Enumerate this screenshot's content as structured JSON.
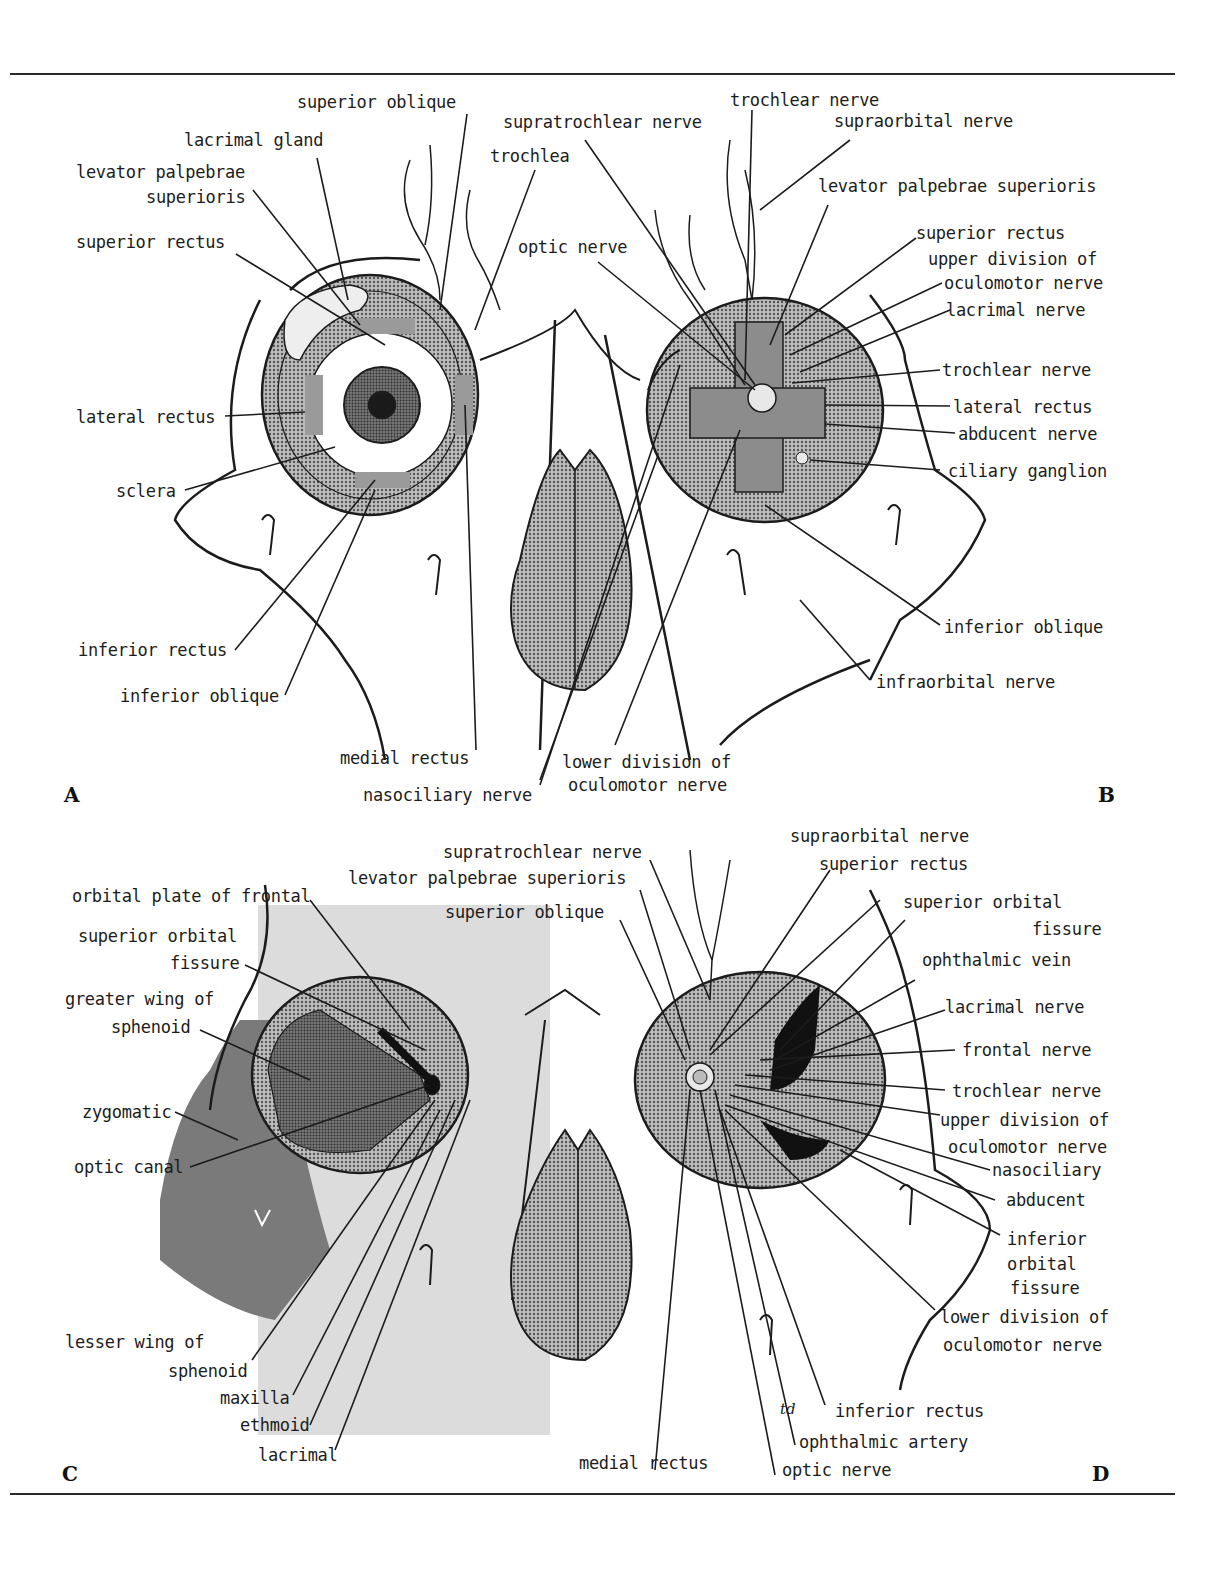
{
  "figure": {
    "panels": [
      {
        "letter": "A",
        "labels": {
          "superior_oblique": "superior oblique",
          "lacrimal_gland": "lacrimal gland",
          "levator_1": "levator palpebrae",
          "levator_2": "superioris",
          "superior_rectus": "superior rectus",
          "trochlea": "trochlea",
          "lateral_rectus": "lateral rectus",
          "sclera": "sclera",
          "inferior_rectus": "inferior rectus",
          "inferior_oblique": "inferior oblique",
          "medial_rectus": "medial rectus",
          "nasociliary_nerve": "nasociliary nerve"
        }
      },
      {
        "letter": "B",
        "labels": {
          "trochlear_nerve_top": "trochlear nerve",
          "supratrochlear_nerve": "supratrochlear nerve",
          "supraorbital_nerve": "supraorbital nerve",
          "levator": "levator palpebrae superioris",
          "optic_nerve": "optic nerve",
          "superior_rectus": "superior rectus",
          "upper_div_1": "upper division of",
          "upper_div_2": "oculomotor nerve",
          "lacrimal_nerve": "lacrimal nerve",
          "trochlear_nerve": "trochlear nerve",
          "lateral_rectus": "lateral rectus",
          "abducent_nerve": "abducent nerve",
          "ciliary_ganglion": "ciliary ganglion",
          "inferior_oblique": "inferior oblique",
          "infraorbital_nerve": "infraorbital nerve",
          "lower_div_1": "lower division of",
          "lower_div_2": "oculomotor nerve"
        }
      },
      {
        "letter": "C",
        "labels": {
          "orbital_plate": "orbital plate of frontal",
          "sof_1": "superior orbital",
          "sof_2": "fissure",
          "greater_wing_1": "greater wing of",
          "greater_wing_2": "sphenoid",
          "zygomatic": "zygomatic",
          "optic_canal": "optic canal",
          "lesser_wing_1": "lesser wing of",
          "lesser_wing_2": "sphenoid",
          "maxilla": "maxilla",
          "ethmoid": "ethmoid",
          "lacrimal": "lacrimal"
        }
      },
      {
        "letter": "D",
        "labels": {
          "supratrochlear_nerve": "supratrochlear nerve",
          "levator": "levator palpebrae superioris",
          "superior_oblique": "superior oblique",
          "supraorbital_nerve": "supraorbital nerve",
          "superior_rectus": "superior rectus",
          "sof_1": "superior orbital",
          "sof_2": "fissure",
          "ophthalmic_vein": "ophthalmic vein",
          "lacrimal_nerve": "lacrimal nerve",
          "frontal_nerve": "frontal nerve",
          "trochlear_nerve": "trochlear nerve",
          "upper_div_1": "upper division of",
          "upper_div_2": "oculomotor nerve",
          "nasociliary": "nasociliary",
          "abducent": "abducent",
          "iof_1": "inferior",
          "iof_2": "orbital",
          "iof_3": "fissure",
          "lower_div_1": "lower division of",
          "lower_div_2": "oculomotor nerve",
          "inferior_rectus": "inferior rectus",
          "ophthalmic_artery": "ophthalmic artery",
          "medial_rectus": "medial rectus",
          "optic_nerve": "optic nerve"
        }
      }
    ],
    "signature": "td",
    "colors": {
      "ink": "#1c1c1c",
      "halftone_mid": "#8a8a8a",
      "halftone_dark": "#5e5e5e",
      "overlay_light": "#d9d9d9",
      "overlay_dark": "#7a7a7a",
      "paper": "#ffffff"
    }
  }
}
